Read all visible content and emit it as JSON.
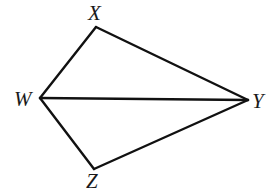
{
  "diagram": {
    "type": "geometry",
    "points": {
      "X": {
        "label": "X",
        "x": 96,
        "y": 27
      },
      "W": {
        "label": "W",
        "x": 40,
        "y": 98
      },
      "Y": {
        "label": "Y",
        "x": 248,
        "y": 100
      },
      "Z": {
        "label": "Z",
        "x": 94,
        "y": 169
      }
    },
    "segments": [
      {
        "from": "W",
        "to": "X"
      },
      {
        "from": "X",
        "to": "Y"
      },
      {
        "from": "Y",
        "to": "Z"
      },
      {
        "from": "Z",
        "to": "W"
      },
      {
        "from": "W",
        "to": "Y"
      }
    ],
    "labels": {
      "X": "X",
      "W": "W",
      "Y": "Y",
      "Z": "Z"
    }
  }
}
